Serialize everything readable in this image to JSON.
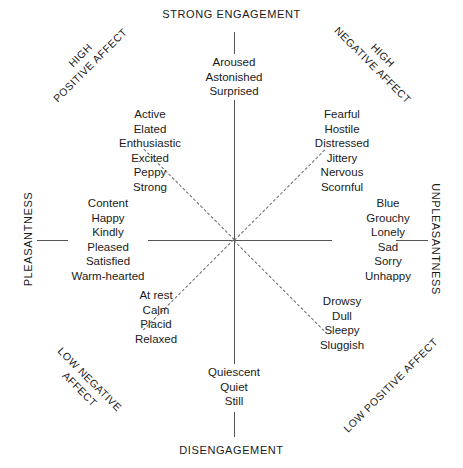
{
  "axes": {
    "top_label": "STRONG ENGAGEMENT",
    "bottom_label": "DISENGAGEMENT",
    "left_label": "PLEASANTNESS",
    "right_label": "UNPLEASANTNESS"
  },
  "diagonals": {
    "top_left": {
      "line1": "HIGH",
      "line2": "POSITIVE AFFECT"
    },
    "top_right": {
      "line1": "HIGH",
      "line2": "NEGATIVE AFFECT"
    },
    "bottom_left": {
      "line1": "LOW NEGATIVE",
      "line2": "AFFECT"
    },
    "bottom_right": {
      "line1": "LOW POSITIVE AFFECT",
      "line2": ""
    }
  },
  "clusters": {
    "top": {
      "name": "high-engagement",
      "words": [
        "Aroused",
        "Astonished",
        "Surprised"
      ]
    },
    "top_left": {
      "name": "high-positive-affect",
      "words": [
        "Active",
        "Elated",
        "Enthusiastic",
        "Excited",
        "Peppy",
        "Strong"
      ]
    },
    "top_right": {
      "name": "high-negative-affect",
      "words": [
        "Fearful",
        "Hostile",
        "Distressed",
        "Jittery",
        "Nervous",
        "Scornful"
      ]
    },
    "left": {
      "name": "pleasantness",
      "words": [
        "Content",
        "Happy",
        "Kindly",
        "Pleased",
        "Satisfied",
        "Warm-hearted"
      ]
    },
    "right": {
      "name": "unpleasantness",
      "words": [
        "Blue",
        "Grouchy",
        "Lonely",
        "Sad",
        "Sorry",
        "Unhappy"
      ]
    },
    "bottom_left": {
      "name": "low-negative-affect",
      "words": [
        "At rest",
        "Calm",
        "Placid",
        "Relaxed"
      ]
    },
    "bottom_right": {
      "name": "low-positive-affect",
      "words": [
        "Drowsy",
        "Dull",
        "Sleepy",
        "Sluggish"
      ]
    },
    "bottom": {
      "name": "disengagement",
      "words": [
        "Quiescent",
        "Quiet",
        "Still"
      ]
    }
  },
  "colors": {
    "background": "#ffffff",
    "text": "#1a1a1a",
    "axis": "#555555",
    "diagonal": "#6a6a6a"
  }
}
